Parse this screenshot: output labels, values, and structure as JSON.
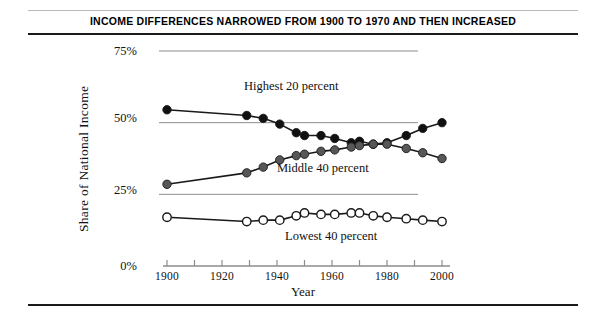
{
  "figure": {
    "title": "INCOME DIFFERENCES NARROWED FROM 1900 TO 1970 AND THEN INCREASED"
  },
  "axes": {
    "y_title": "Share of National Income",
    "x_title": "Year",
    "y_ticks": [
      "0%",
      "25%",
      "50%",
      "75%"
    ],
    "x_ticks": [
      "1900",
      "1920",
      "1940",
      "1960",
      "1980",
      "2000"
    ]
  },
  "series_labels": {
    "highest": "Highest 20 percent",
    "middle": "Middle 40 percent",
    "lowest": "Lowest 40 percent"
  },
  "colors": {
    "highest_marker": "#111111",
    "middle_marker": "#575757",
    "lowest_marker": "#ffffff",
    "line": "#1a1a1a",
    "gridline": "#8d8d8d",
    "rule_dark": "#1a1a1a",
    "rule_light": "#b9b9b9"
  },
  "chart_data": {
    "type": "line",
    "title": "INCOME DIFFERENCES NARROWED FROM 1900 TO 1970 AND THEN INCREASED",
    "xlabel": "Year",
    "ylabel": "Share of National Income",
    "xlim": [
      1900,
      2000
    ],
    "ylim": [
      0,
      75
    ],
    "yticks": [
      0,
      25,
      50,
      75
    ],
    "xticks": [
      1900,
      1920,
      1940,
      1960,
      1980,
      2000
    ],
    "grid": "horizontal",
    "legend": "inline-annotations",
    "series": [
      {
        "name": "Highest 20 percent",
        "marker": "filled-black-circle",
        "x": [
          1900,
          1929,
          1935,
          1941,
          1947,
          1950,
          1956,
          1961,
          1967,
          1970,
          1975,
          1980,
          1987,
          1993,
          2000
        ],
        "values": [
          54.5,
          52.5,
          51.5,
          49.5,
          46.5,
          45.5,
          45.5,
          44.5,
          43.0,
          43.5,
          42.5,
          43.0,
          45.5,
          48.0,
          50.0
        ]
      },
      {
        "name": "Middle 40 percent",
        "marker": "filled-gray-circle",
        "x": [
          1900,
          1929,
          1935,
          1941,
          1947,
          1950,
          1956,
          1961,
          1967,
          1970,
          1975,
          1980,
          1987,
          1993,
          2000
        ],
        "values": [
          28.5,
          32.5,
          34.5,
          37.0,
          38.5,
          39.0,
          40.0,
          40.5,
          41.5,
          42.0,
          42.5,
          42.5,
          41.0,
          39.5,
          37.5
        ]
      },
      {
        "name": "Lowest 40 percent",
        "marker": "hollow-white-circle",
        "x": [
          1900,
          1929,
          1935,
          1941,
          1947,
          1950,
          1956,
          1961,
          1967,
          1970,
          1975,
          1980,
          1987,
          1993,
          2000
        ],
        "values": [
          17.0,
          15.5,
          16.0,
          16.0,
          17.5,
          18.5,
          18.0,
          18.0,
          18.5,
          18.5,
          17.5,
          17.0,
          16.5,
          16.0,
          15.5
        ]
      }
    ]
  }
}
